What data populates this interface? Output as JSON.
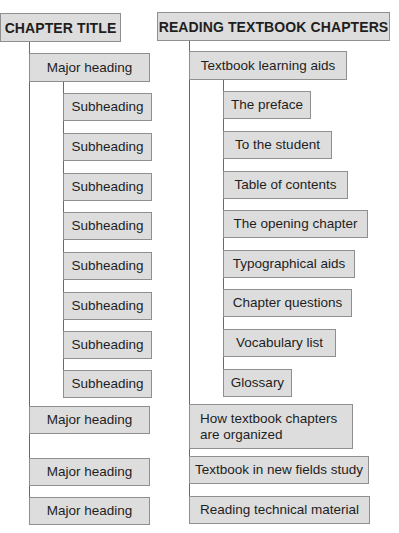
{
  "left_outline": {
    "title": "CHAPTER TITLE",
    "major_heading_1": "Major heading",
    "subheadings": [
      "Subheading",
      "Subheading",
      "Subheading",
      "Subheading",
      "Subheading",
      "Subheading",
      "Subheading",
      "Subheading"
    ],
    "major_heading_2": "Major heading",
    "major_heading_3": "Major heading",
    "major_heading_4": "Major heading"
  },
  "right_outline": {
    "title": "READING TEXTBOOK CHAPTERS",
    "major_heading_1": "Textbook learning aids",
    "subheadings": [
      "The preface",
      "To the student",
      "Table of contents",
      "The opening chapter",
      "Typographical aids",
      "Chapter questions",
      "Vocabulary list",
      "Glossary"
    ],
    "major_heading_2": "How textbook chapters are organized",
    "major_heading_3": "Textbook in new fields study",
    "major_heading_4": "Reading technical material"
  },
  "colors": {
    "box_fill": "#dddddd",
    "box_border": "#8f8f8f",
    "connector": "#6a6a6a"
  }
}
